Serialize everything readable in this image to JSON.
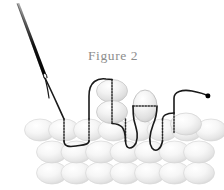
{
  "figure": {
    "caption": "Figure 2",
    "caption_color": "#8d8d8d",
    "caption_x": 88,
    "caption_y": 60,
    "background_color": "#ffffff"
  },
  "colors": {
    "bead_fill_light": "#fdfdfd",
    "bead_fill_mid": "#e8e8e8",
    "bead_fill_shadow": "#cfcfcf",
    "bead_outline": "#d2d2d2",
    "thread_solid": "#1a1a1a",
    "thread_dotted": "#2b2b2b",
    "needle_dark": "#0d0d0d",
    "needle_light": "#9a9a9a",
    "end_dot": "#000000"
  },
  "needle": {
    "name": "sewing-needle",
    "tip_x": 17,
    "tip_y": 4,
    "eye_x": 45,
    "eye_y": 76,
    "width_px": 3
  },
  "thread": {
    "name": "working-thread",
    "start_x": 45,
    "start_y": 78,
    "end_x": 208,
    "end_y": 96,
    "stroke_width": 1.6,
    "dash_pattern": "1.4 1.6",
    "description": "thread passes from needle down into the bead fabric, loops up and over raised beads, and terminates at a knot dot on the right"
  },
  "end_marker": {
    "name": "thread-end-dot",
    "x": 208,
    "y": 96,
    "size": 3.4
  },
  "bead_rows": [
    {
      "name": "bead-row-top",
      "y": 130,
      "rx": 15.5,
      "ry": 11.0,
      "start_x": 40,
      "spacing": 24.5,
      "count": 8
    },
    {
      "name": "bead-row-middle",
      "y": 152,
      "rx": 15.5,
      "ry": 11.0,
      "start_x": 52,
      "spacing": 24.5,
      "count": 7
    },
    {
      "name": "bead-row-bottom",
      "y": 173,
      "rx": 15.5,
      "ry": 11.0,
      "start_x": 52,
      "spacing": 24.5,
      "count": 7
    }
  ],
  "raised_beads": [
    {
      "name": "raised-bead-upper",
      "cx": 112,
      "cy": 91,
      "rx": 15.5,
      "ry": 11.5,
      "thread": "vertical-dotted"
    },
    {
      "name": "raised-bead-lower",
      "cx": 112,
      "cy": 112,
      "rx": 15.5,
      "ry": 11.5,
      "thread": "vertical-dotted"
    },
    {
      "name": "upright-egg-bead",
      "cx": 145,
      "cy": 106,
      "rx": 12.0,
      "ry": 16.0,
      "thread": "horizontal-dotted"
    }
  ],
  "threaded_beads": [
    {
      "name": "threaded-bead-1",
      "cx": 64,
      "cy": 130
    },
    {
      "name": "threaded-bead-2",
      "cx": 89,
      "cy": 130
    },
    {
      "name": "threaded-bead-3",
      "cx": 125,
      "cy": 130
    },
    {
      "name": "threaded-bead-4",
      "cx": 162,
      "cy": 130
    },
    {
      "name": "threaded-bead-5",
      "cx": 186,
      "cy": 124
    }
  ]
}
